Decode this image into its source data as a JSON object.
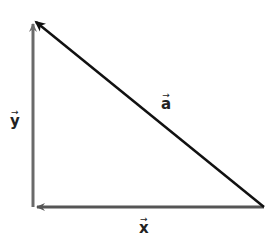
{
  "diagram": {
    "type": "vector-triangle",
    "vectors": [
      {
        "name": "x",
        "label": "x",
        "from": [
          264,
          207
        ],
        "to": [
          33,
          207
        ],
        "color": "#555555"
      },
      {
        "name": "y",
        "label": "y",
        "from": [
          33,
          207
        ],
        "to": [
          33,
          20
        ],
        "color": "#6a6a6a"
      },
      {
        "name": "a",
        "label": "a",
        "from": [
          264,
          207
        ],
        "to": [
          33,
          20
        ],
        "color": "#111111"
      }
    ],
    "labels": {
      "x": "x",
      "y": "y",
      "a": "a",
      "arrow": "→"
    }
  }
}
